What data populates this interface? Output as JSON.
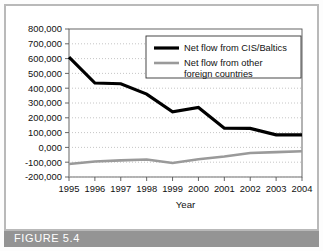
{
  "figure": {
    "caption": "FIGURE 5.4"
  },
  "chart_data": {
    "type": "line",
    "title": "",
    "xlabel": "Year",
    "ylabel": "",
    "x": [
      1995,
      1996,
      1997,
      1998,
      1999,
      2000,
      2001,
      2002,
      2003,
      2004
    ],
    "categories": [
      "1995",
      "1996",
      "1997",
      "1998",
      "1999",
      "2000",
      "2001",
      "2002",
      "2003",
      "2004"
    ],
    "ylim": [
      -200000,
      800000
    ],
    "yticks": [
      800000,
      700000,
      600000,
      500000,
      400000,
      300000,
      200000,
      100000,
      0,
      -100000,
      -200000
    ],
    "ytick_labels": [
      "800,000",
      "700,000",
      "600,000",
      "500,000",
      "400,000",
      "300,000",
      "200,000",
      "100,000",
      "0,000",
      "-100,000",
      "-200,000"
    ],
    "grid": true,
    "grid_style": "dotted-horizontal",
    "legend_position": "top-right",
    "series": [
      {
        "name": "Net flow from CIS/Baltics",
        "color": "#000000",
        "width": 3.2,
        "values": [
          610000,
          435000,
          430000,
          360000,
          240000,
          270000,
          130000,
          128000,
          85000,
          85000
        ]
      },
      {
        "name": "Net flow from other foreign countries",
        "color": "#9a9a9a",
        "width": 2.6,
        "values": [
          -112000,
          -95000,
          -88000,
          -82000,
          -105000,
          -80000,
          -62000,
          -38000,
          -32000,
          -26000
        ]
      }
    ]
  },
  "legend": {
    "entries": [
      {
        "label": "Net flow from CIS/Baltics"
      },
      {
        "label_line1": "Net flow from other",
        "label_line2": "foreign countries"
      }
    ]
  },
  "colors": {
    "series_primary": "#000000",
    "series_secondary": "#9a9a9a",
    "caption_bar": "#949494",
    "frame": "#b9b9b9",
    "axis": "#555555",
    "grid": "#bfbfbf"
  }
}
